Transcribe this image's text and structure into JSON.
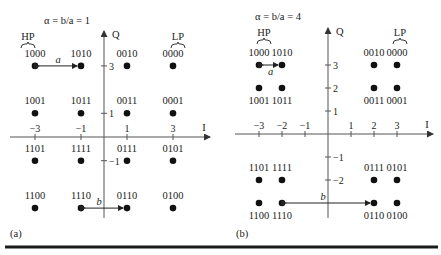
{
  "chart_data": [
    {
      "type": "scatter",
      "title": "α = b/a = 1",
      "panel_label": "(a)",
      "xlabel": "I",
      "ylabel": "Q",
      "x_ticks": [
        -3,
        -1,
        1,
        3
      ],
      "y_ticks": [
        3,
        1,
        -1
      ],
      "hp_label": "HP",
      "lp_label": "LP",
      "a_label": "a",
      "b_label": "b",
      "points": [
        {
          "x": -3,
          "y": 3,
          "label": "1000",
          "label_pos": "above"
        },
        {
          "x": -1,
          "y": 3,
          "label": "1010",
          "label_pos": "above"
        },
        {
          "x": 1,
          "y": 3,
          "label": "0010",
          "label_pos": "above"
        },
        {
          "x": 3,
          "y": 3,
          "label": "0000",
          "label_pos": "above"
        },
        {
          "x": -3,
          "y": 1,
          "label": "1001",
          "label_pos": "above"
        },
        {
          "x": -1,
          "y": 1,
          "label": "1011",
          "label_pos": "above"
        },
        {
          "x": 1,
          "y": 1,
          "label": "0011",
          "label_pos": "above"
        },
        {
          "x": 3,
          "y": 1,
          "label": "0001",
          "label_pos": "above"
        },
        {
          "x": -3,
          "y": -1,
          "label": "1101",
          "label_pos": "above"
        },
        {
          "x": -1,
          "y": -1,
          "label": "1111",
          "label_pos": "above"
        },
        {
          "x": 1,
          "y": -1,
          "label": "0111",
          "label_pos": "above"
        },
        {
          "x": 3,
          "y": -1,
          "label": "0101",
          "label_pos": "above"
        },
        {
          "x": -3,
          "y": -3,
          "label": "1100",
          "label_pos": "above"
        },
        {
          "x": -1,
          "y": -3,
          "label": "1110",
          "label_pos": "above"
        },
        {
          "x": 1,
          "y": -3,
          "label": "0110",
          "label_pos": "above"
        },
        {
          "x": 3,
          "y": -3,
          "label": "0100",
          "label_pos": "above"
        }
      ]
    },
    {
      "type": "scatter",
      "title": "α = b/a = 4",
      "panel_label": "(b)",
      "xlabel": "I",
      "ylabel": "Q",
      "x_ticks": [
        -3,
        -2,
        -1,
        1,
        2,
        3
      ],
      "y_ticks": [
        3,
        2,
        1,
        -1,
        -2
      ],
      "hp_label": "HP",
      "lp_label": "LP",
      "a_label": "a",
      "b_label": "b",
      "points": [
        {
          "x": -3,
          "y": 3,
          "label": "1000",
          "label_pos": "above"
        },
        {
          "x": -2,
          "y": 3,
          "label": "1010",
          "label_pos": "above"
        },
        {
          "x": 2,
          "y": 3,
          "label": "0010",
          "label_pos": "above"
        },
        {
          "x": 3,
          "y": 3,
          "label": "0000",
          "label_pos": "above"
        },
        {
          "x": -3,
          "y": 2,
          "label": "1001",
          "label_pos": "below"
        },
        {
          "x": -2,
          "y": 2,
          "label": "1011",
          "label_pos": "below"
        },
        {
          "x": 2,
          "y": 2,
          "label": "0011",
          "label_pos": "below"
        },
        {
          "x": 3,
          "y": 2,
          "label": "0001",
          "label_pos": "below"
        },
        {
          "x": -3,
          "y": -2,
          "label": "1101",
          "label_pos": "above"
        },
        {
          "x": -2,
          "y": -2,
          "label": "1111",
          "label_pos": "above"
        },
        {
          "x": 2,
          "y": -2,
          "label": "0111",
          "label_pos": "above"
        },
        {
          "x": 3,
          "y": -2,
          "label": "0101",
          "label_pos": "above"
        },
        {
          "x": -3,
          "y": -3,
          "label": "1100",
          "label_pos": "below"
        },
        {
          "x": -2,
          "y": -3,
          "label": "1110",
          "label_pos": "below"
        },
        {
          "x": 2,
          "y": -3,
          "label": "0110",
          "label_pos": "below"
        },
        {
          "x": 3,
          "y": -3,
          "label": "0100",
          "label_pos": "below"
        }
      ]
    }
  ],
  "layout": [
    {
      "ox": 104,
      "oy": 137,
      "sx": 23,
      "sy": 23.7,
      "axis_x0": 10,
      "axis_x1": 210,
      "axis_y0": 218,
      "axis_y1": 31,
      "title_x": 44,
      "title_y": 24,
      "hp_x": 28,
      "hp_y": 40,
      "lp_x": 178,
      "lp_y": 40,
      "a_pair": [
        0,
        1
      ],
      "b_pair": [
        13,
        14
      ],
      "panel_x": 10,
      "panel_y": 237,
      "tick_label_x_dy": -6,
      "tick_label_y_side": "right"
    },
    {
      "ox": 328,
      "oy": 134,
      "sx": 23,
      "sy": 23,
      "axis_x0": 235,
      "axis_x1": 433,
      "axis_y0": 218,
      "axis_y1": 28,
      "title_x": 255,
      "title_y": 20,
      "hp_x": 264,
      "hp_y": 36,
      "lp_x": 400,
      "lp_y": 36,
      "a_pair": [
        0,
        1
      ],
      "b_pair": [
        13,
        14
      ],
      "panel_x": 236,
      "panel_y": 237,
      "tick_label_x_dy": -6,
      "tick_label_y_side": "right"
    }
  ],
  "rule": {
    "y": 247,
    "x0": 5,
    "x1": 438,
    "color": "#1a1a1a"
  }
}
